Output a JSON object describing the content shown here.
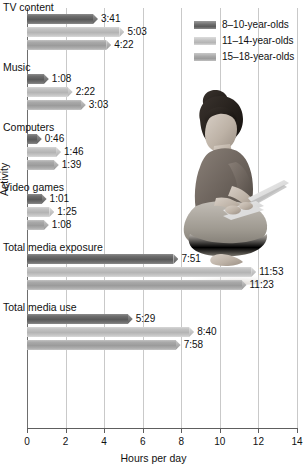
{
  "chart_data": {
    "type": "bar",
    "orientation": "horizontal",
    "title": "",
    "xlabel": "Hours per day",
    "ylabel": "Activity",
    "xlim": [
      0,
      14
    ],
    "xticks": [
      0,
      2,
      4,
      6,
      8,
      10,
      12,
      14
    ],
    "xtick_labels": [
      "0",
      "2",
      "4",
      "6",
      "8",
      "10",
      "12",
      "14"
    ],
    "grid": "vertical",
    "legend_position": "top-right",
    "categories": [
      "TV content",
      "Music",
      "Computers",
      "Video games",
      "Total media exposure",
      "Total media use"
    ],
    "series": [
      {
        "name": "8–10-year-olds",
        "color": "#6d6d6d",
        "labels": [
          "3:41",
          "1:08",
          "0:46",
          "1:01",
          "7:51",
          "5:29"
        ],
        "values": [
          3.683,
          1.133,
          0.767,
          1.017,
          7.85,
          5.483
        ]
      },
      {
        "name": "11–14-year-olds",
        "color": "#c2c2c2",
        "labels": [
          "5:03",
          "2:22",
          "1:46",
          "1:25",
          "11:53",
          "8:40"
        ],
        "values": [
          5.05,
          2.367,
          1.767,
          1.417,
          11.883,
          8.667
        ]
      },
      {
        "name": "15–18-year-olds",
        "color": "#a9a9a9",
        "labels": [
          "4:22",
          "3:03",
          "1:39",
          "1:08",
          "11:23",
          "7:58"
        ],
        "values": [
          4.367,
          3.05,
          1.65,
          1.133,
          11.383,
          7.967
        ]
      }
    ]
  },
  "legend": {
    "items": [
      {
        "label": "8–10-year-olds",
        "swatch": "legend-swatch-8-10"
      },
      {
        "label": "11–14-year-olds",
        "swatch": "legend-swatch-11-14"
      },
      {
        "label": "15–18-year-olds",
        "swatch": "legend-swatch-15-18"
      }
    ]
  },
  "axes": {
    "x_title": "Hours per day",
    "y_title": "Activity"
  },
  "photo": {
    "description": "grayscale-photo-person-sitting-with-laptop"
  }
}
